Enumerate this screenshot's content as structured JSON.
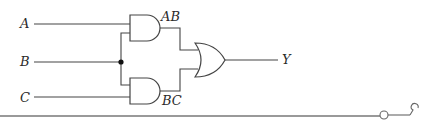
{
  "diagram": {
    "type": "logic-circuit",
    "inputs": [
      {
        "id": "A",
        "label": "A"
      },
      {
        "id": "B",
        "label": "B"
      },
      {
        "id": "C",
        "label": "C"
      }
    ],
    "gates": [
      {
        "id": "and1",
        "type": "AND",
        "inputs": [
          "A",
          "B"
        ],
        "output_label": "AB"
      },
      {
        "id": "and2",
        "type": "AND",
        "inputs": [
          "B",
          "C"
        ],
        "output_label": "BC"
      },
      {
        "id": "or1",
        "type": "OR",
        "inputs": [
          "AB",
          "BC"
        ],
        "output_label": "Y"
      }
    ],
    "output": {
      "id": "Y",
      "label": "Y"
    },
    "junction": {
      "node": "B",
      "note": "B fans out to both AND gates"
    }
  },
  "colors": {
    "line": "#444444",
    "rule": "#777777",
    "background": "#ffffff"
  }
}
